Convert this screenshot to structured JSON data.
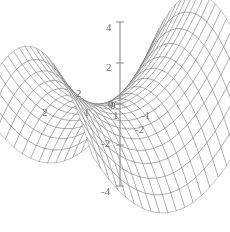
{
  "figure": {
    "background_color": "#ffffff",
    "mesh_color": "#6b6b6b",
    "label_color": "#6d6d6d",
    "width": 230,
    "height": 232
  },
  "chart_data": {
    "type": "line",
    "plot_kind": "3d-wireframe-surface",
    "title": "",
    "subtitle": "",
    "xlabel": "",
    "ylabel": "",
    "zlabel": "",
    "grid": true,
    "legend": null,
    "legend_position": "none",
    "surface_equation": "z = x^2 - y^2",
    "mesh_divisions_u": 20,
    "mesh_divisions_v": 20,
    "x": [
      -2,
      -1.8,
      -1.6,
      -1.4,
      -1.2,
      -1,
      -0.8,
      -0.6,
      -0.4,
      -0.2,
      0,
      0.2,
      0.4,
      0.6,
      0.8,
      1,
      1.2,
      1.4,
      1.6,
      1.8,
      2
    ],
    "y": [
      -2,
      -1.8,
      -1.6,
      -1.4,
      -1.2,
      -1,
      -0.8,
      -0.6,
      -0.4,
      -0.2,
      0,
      0.2,
      0.4,
      0.6,
      0.8,
      1,
      1.2,
      1.4,
      1.6,
      1.8,
      2
    ],
    "xlim": [
      -2,
      2
    ],
    "ylim": [
      -2,
      2
    ],
    "zlim": [
      -4,
      4
    ],
    "x_ticks": [
      2,
      1,
      0
    ],
    "y_ticks": [
      0,
      -1,
      -2
    ],
    "z_ticks": [
      4,
      2,
      0,
      -2,
      -4
    ],
    "z_tick_labels": [
      "4",
      "2",
      "0",
      "-2",
      "-4"
    ],
    "camera": {
      "elevation_deg": 22,
      "azimuth_deg": 35
    },
    "series": [
      {
        "name": "z = x^2 - y^2",
        "corner_values": {
          "x-2_y-2": 0,
          "x-2_y2": 0,
          "x2_y-2": 0,
          "x2_y2": 0,
          "x-2_y0": 4,
          "x2_y0": 4,
          "x0_y-2": -4,
          "x0_y2": -4,
          "x0_y0": 0
        }
      }
    ]
  },
  "axes": {
    "vertical_axis_name": "z-axis",
    "tick_labels": [
      {
        "name": "z-tick-4",
        "text": "4",
        "x": 106,
        "y": 22,
        "axis": "z"
      },
      {
        "name": "z-tick-2",
        "text": "2",
        "x": 106,
        "y": 62,
        "axis": "z"
      },
      {
        "name": "z-tick-0",
        "text": "0",
        "x": 108,
        "y": 99,
        "axis": "z"
      },
      {
        "name": "z-tick-neg2",
        "text": "-2",
        "x": 101,
        "y": 138,
        "axis": "z"
      },
      {
        "name": "z-tick-neg4",
        "text": "-4",
        "x": 101,
        "y": 186,
        "axis": "z"
      },
      {
        "name": "x-tick-2",
        "text": "2",
        "x": 76,
        "y": 88,
        "axis": "x"
      },
      {
        "name": "x-tick-2-outer",
        "text": "2",
        "x": 42,
        "y": 107,
        "axis": "x"
      },
      {
        "name": "x-tick-1",
        "text": "1",
        "x": 84,
        "y": 107,
        "axis": "x"
      },
      {
        "name": "x-tick-0",
        "text": "0",
        "x": 110,
        "y": 100,
        "axis": "x"
      },
      {
        "name": "y-tick-1",
        "text": "1",
        "x": 113,
        "y": 110,
        "axis": "y"
      },
      {
        "name": "y-tick-neg1",
        "text": "-1",
        "x": 141,
        "y": 110,
        "axis": "y"
      },
      {
        "name": "y-tick-neg2",
        "text": "-2",
        "x": 135,
        "y": 124,
        "axis": "y"
      }
    ]
  }
}
